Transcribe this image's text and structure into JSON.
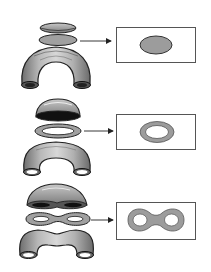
{
  "diagram": {
    "type": "cross-section illustration",
    "colors": {
      "background": "#ffffff",
      "outline": "#222222",
      "surface_fill": "#a8a8a8",
      "surface_light": "#d6d6d6",
      "section_fill": "#9c9c9c",
      "hollow": "#ffffff",
      "dark_interior": "#111111",
      "box_border": "#555555",
      "arrow": "#222222"
    },
    "rows": [
      {
        "id": "solid-tube",
        "object": "solid curved tube (no hole)",
        "slice_shape": "filled ellipse",
        "cross_section": "filled ellipse"
      },
      {
        "id": "hollow-tube",
        "object": "hollow curved tube (one hole)",
        "slice_shape": "ring",
        "cross_section": "annulus (ring)"
      },
      {
        "id": "double-hollow-tube",
        "object": "curved tube with two channels",
        "slice_shape": "figure-eight",
        "cross_section": "figure-eight (two holes)"
      }
    ]
  }
}
